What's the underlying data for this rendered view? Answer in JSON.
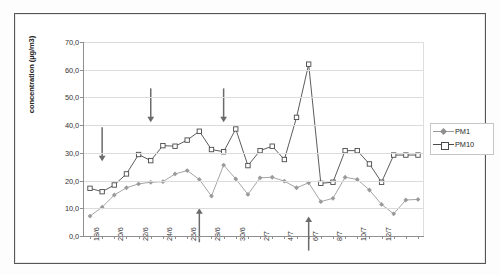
{
  "chart_data": {
    "type": "line",
    "title": "",
    "subtitle": "",
    "xlabel": "",
    "ylabel": "concentration (µg/m3)",
    "ylim": [
      0,
      70
    ],
    "ytick_step": 10,
    "yticks": [
      "0,0",
      "10,0",
      "20,0",
      "30,0",
      "40,0",
      "50,0",
      "60,0",
      "70,0"
    ],
    "ytick_values": [
      0,
      10,
      20,
      30,
      40,
      50,
      60,
      70
    ],
    "grid": true,
    "grid_axis": "y",
    "legend_position": "right",
    "x": [
      "18/6",
      "19/6",
      "20/6",
      "21/6",
      "22/6",
      "23/6",
      "24/6",
      "25/6",
      "26/6",
      "27/6",
      "28/6",
      "29/6",
      "30/6",
      "1/7",
      "2/7",
      "3/7",
      "4/7",
      "5/7",
      "6/7",
      "7/7",
      "8/7",
      "9/7",
      "10/7",
      "11/7",
      "12/7",
      "13/7",
      "14/7",
      "15/7"
    ],
    "xtick_labels": [
      "18/6",
      "20/6",
      "22/6",
      "24/6",
      "26/6",
      "28/6",
      "30/6",
      "2/7",
      "4/7",
      "6/7",
      "8/7",
      "10/7",
      "12/7"
    ],
    "xtick_every": 2,
    "series": [
      {
        "name": "PM1",
        "color": "#9a9a9a",
        "marker": "diamond",
        "values": [
          7.2,
          10.4,
          14.8,
          17.4,
          18.8,
          19.4,
          19.6,
          22.4,
          23.6,
          20.4,
          14.4,
          25.6,
          20.6,
          15.0,
          21.0,
          21.2,
          19.8,
          17.4,
          19.2,
          12.4,
          13.6,
          21.2,
          20.4,
          16.6,
          11.4,
          8.0,
          13.0,
          13.2
        ]
      },
      {
        "name": "PM10",
        "color": "#4a4a4a",
        "marker": "square",
        "values": [
          17.2,
          16.0,
          18.4,
          22.4,
          29.4,
          27.2,
          32.6,
          32.4,
          34.6,
          37.8,
          31.2,
          30.4,
          38.6,
          25.4,
          30.8,
          32.4,
          27.6,
          42.8,
          62.0,
          19.0,
          19.4,
          30.8,
          30.8,
          26.0,
          19.4,
          29.2,
          29.2,
          29.2
        ]
      }
    ],
    "annotations": [
      {
        "type": "arrow-down",
        "label": "arrow-down-1",
        "x_index": 1,
        "y_value": 27.0
      },
      {
        "type": "arrow-down",
        "label": "arrow-down-2",
        "x_index": 5,
        "y_value": 41.0
      },
      {
        "type": "arrow-down",
        "label": "arrow-down-3",
        "x_index": 11,
        "y_value": 41.0
      },
      {
        "type": "arrow-up",
        "label": "arrow-up-1",
        "x_index": 9,
        "y_value": 10.0
      },
      {
        "type": "arrow-up",
        "label": "arrow-up-2",
        "x_index": 18,
        "y_value": 7.0
      }
    ]
  },
  "legend": {
    "items": [
      {
        "label": "PM1"
      },
      {
        "label": "PM10"
      }
    ]
  }
}
